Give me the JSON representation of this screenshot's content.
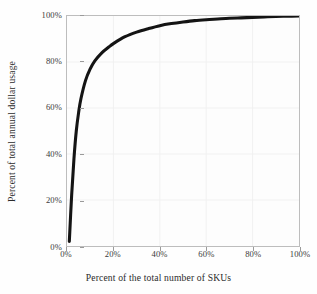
{
  "chart_data": {
    "type": "line",
    "title": "",
    "subtitle": "",
    "xlabel": "Percent of the total number of SKUs",
    "ylabel": "Percent of total annual dollar usage",
    "xlim": [
      0,
      100
    ],
    "ylim": [
      0,
      100
    ],
    "grid": true,
    "legend": null,
    "xticks": [
      "0%",
      "20%",
      "40%",
      "60%",
      "80%",
      "100%"
    ],
    "xtick_values": [
      0,
      20,
      40,
      60,
      80,
      100
    ],
    "yticks": [
      "0%",
      "20%",
      "40%",
      "60%",
      "80%",
      "100%"
    ],
    "ytick_values": [
      0,
      20,
      40,
      60,
      80,
      100
    ],
    "series": [
      {
        "name": "Cumulative annual dollar usage",
        "color": "#141414",
        "x": [
          1,
          2,
          3,
          4,
          5,
          6,
          8,
          10,
          12,
          15,
          18,
          20,
          25,
          30,
          35,
          40,
          45,
          50,
          55,
          60,
          65,
          70,
          75,
          80,
          85,
          90,
          95,
          100
        ],
        "y": [
          2,
          22,
          38,
          50,
          58,
          64,
          72,
          77,
          80.5,
          84,
          86.5,
          88,
          91,
          93,
          94.5,
          95.8,
          96.7,
          97.4,
          98,
          98.4,
          98.7,
          99,
          99.2,
          99.4,
          99.6,
          99.8,
          99.9,
          100
        ]
      }
    ],
    "annotations": [],
    "axis_tick_color": "#9a9a9a",
    "frame_color": "#bdbdbd",
    "gridline_color": "#f1f1f1",
    "background_color": "#fdfdfd"
  }
}
